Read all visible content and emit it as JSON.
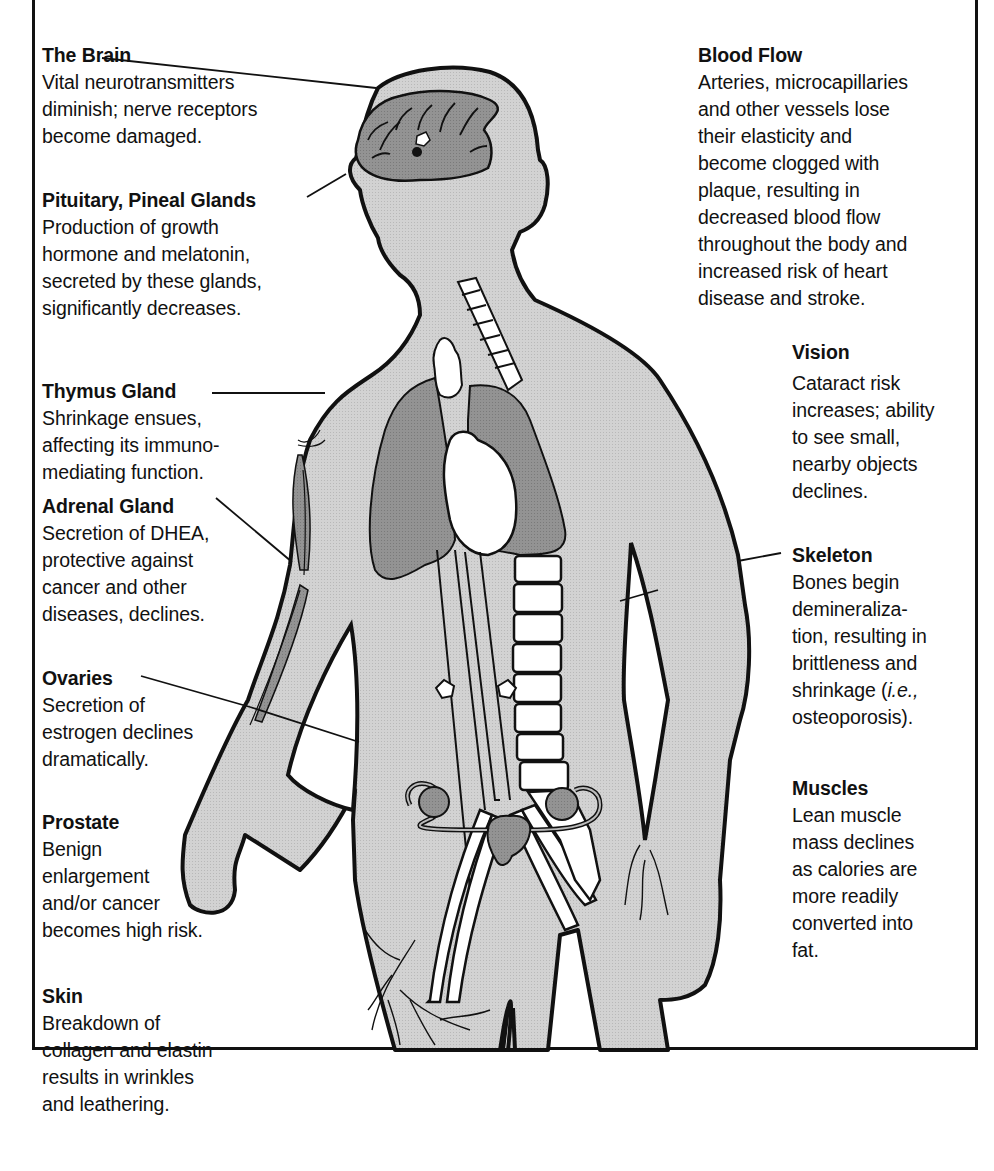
{
  "diagram": {
    "topic": "Effects of aging on the human body",
    "colors": {
      "body_fill": "#cfcfcf",
      "organ_fill": "#8f8f8f",
      "outline": "#111111",
      "bone_fill": "#ffffff",
      "frame": "#111111"
    }
  },
  "labels": {
    "brain": {
      "title": "The Brain",
      "desc": "Vital neurotransmitters\ndiminish; nerve receptors\nbecome damaged."
    },
    "pituitary": {
      "title": "Pituitary, Pineal Glands",
      "desc": "Production of growth\nhormone and melatonin,\nsecreted by these glands,\nsignificantly decreases."
    },
    "thymus": {
      "title": "Thymus Gland",
      "desc": "Shrinkage ensues,\naffecting  its immuno-\nmediating  function."
    },
    "adrenal": {
      "title": "Adrenal Gland",
      "desc": "Secretion of DHEA,\nprotective against\ncancer and other\ndiseases, declines."
    },
    "ovaries": {
      "title": "Ovaries",
      "desc": "Secretion of\nestrogen declines\ndramatically."
    },
    "prostate": {
      "title": "Prostate",
      "desc": "Benign\nenlargement\nand/or cancer\nbecomes high risk."
    },
    "skin": {
      "title": "Skin",
      "desc": "Breakdown of\ncollagen and elastin\nresults in wrinkles\nand leathering."
    },
    "blood_flow": {
      "title": "Blood Flow",
      "desc": "Arteries, microcapillaries\nand other vessels lose\ntheir elasticity and\nbecome clogged with\nplaque, resulting in\ndecreased blood flow\nthroughout the body and\nincreased risk of heart\ndisease and stroke."
    },
    "vision": {
      "title": "Vision",
      "desc": "Cataract risk\nincreases; ability\nto see small,\nnearby objects\ndeclines."
    },
    "skeleton": {
      "title": "Skeleton",
      "desc_before_italic": "Bones begin\ndemineraliza-\ntion, resulting in\nbrittleness and\nshrinkage (",
      "desc_italic": "i.e.,",
      "desc_after_italic": "\nosteoporosis)."
    },
    "muscles": {
      "title": "Muscles",
      "desc": "Lean muscle\nmass declines\nas  calories are\nmore readily\nconverted into\nfat."
    }
  }
}
